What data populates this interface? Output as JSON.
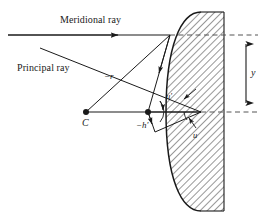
{
  "figure": {
    "labels": {
      "meridional_ray": "Meridional ray",
      "principal_ray": "Principal ray",
      "radius": "−r",
      "center_of_curvature": "C",
      "image_height": "−h′",
      "angle_u_prime": "u′",
      "angle_u": "u",
      "ray_height": "y"
    },
    "colors": {
      "ink": "#1a1a1a",
      "line": "#333333",
      "hatch": "#4a4a4a",
      "dash": "#555555",
      "background": "#ffffff"
    },
    "geometry": {
      "axis_y": 112,
      "meridional_ray_y": 35,
      "surface_vertex_x": 201,
      "glass_right_x": 224,
      "center_point": {
        "x": 86,
        "y": 112
      },
      "image_point": {
        "x": 148,
        "y": 112
      },
      "strike_point": {
        "x": 170,
        "y": 35
      },
      "dimension_x": 246,
      "hatch_angle_deg": 45
    },
    "elements": [
      {
        "name": "meridional-ray",
        "kind": "ray",
        "label": "Meridional ray"
      },
      {
        "name": "principal-ray",
        "kind": "ray",
        "label": "Principal ray"
      },
      {
        "name": "radius-line",
        "kind": "construction",
        "label": "−r"
      },
      {
        "name": "refracted-ray",
        "kind": "ray",
        "label": ""
      },
      {
        "name": "optical-axis",
        "kind": "axis",
        "label": ""
      },
      {
        "name": "glass-medium",
        "kind": "region",
        "label": ""
      },
      {
        "name": "height-dimension",
        "kind": "dimension",
        "label": "y"
      }
    ]
  }
}
